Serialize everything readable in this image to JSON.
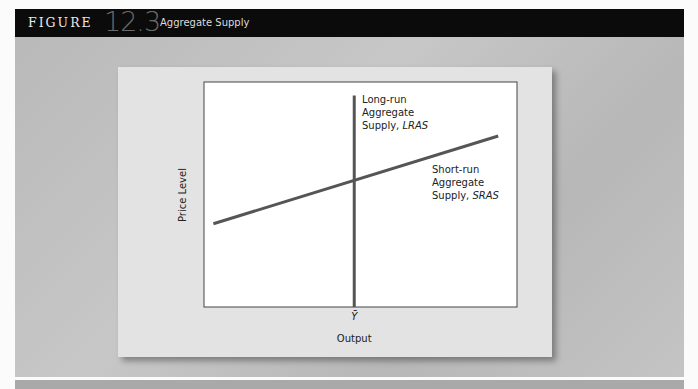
{
  "figure": {
    "prefix": "FIGURE",
    "number": "12.3",
    "title": "Aggregate Supply"
  },
  "chart_data": {
    "type": "line",
    "title": "Aggregate Supply",
    "xlabel": "Output",
    "ylabel": "Price Level",
    "x_ticks": [
      {
        "label": "Ȳ",
        "value": 0.48
      }
    ],
    "y_ticks": [],
    "xlim": [
      0,
      1
    ],
    "ylim": [
      0,
      1
    ],
    "grid": false,
    "series": [
      {
        "name": "LRAS",
        "label_lines": [
          "Long-run",
          "Aggregate",
          "Supply, "
        ],
        "label_italic": "LRAS",
        "points": [
          [
            0.48,
            0.0
          ],
          [
            0.48,
            0.94
          ]
        ],
        "color": "#555555"
      },
      {
        "name": "SRAS",
        "label_lines": [
          "Short-run",
          "Aggregate",
          "Supply, "
        ],
        "label_italic": "SRAS",
        "points": [
          [
            0.03,
            0.37
          ],
          [
            0.94,
            0.76
          ]
        ],
        "color": "#555555"
      }
    ]
  }
}
